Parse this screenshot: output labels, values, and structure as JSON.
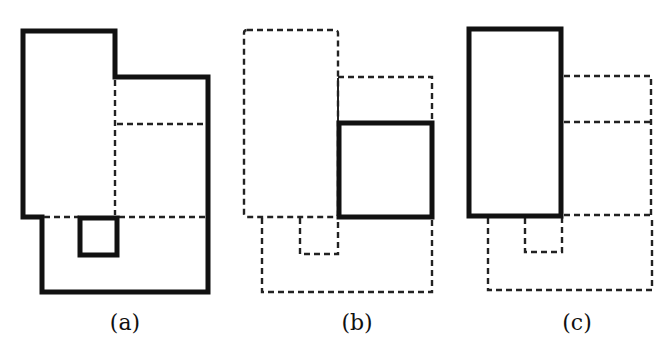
{
  "figure": {
    "panels": [
      {
        "id": "a",
        "label": "(a)",
        "description": "Full floorplan outline highlighted; small inner room highlighted",
        "thick_shapes": [
          "outer-outline",
          "small-square"
        ],
        "dashed_shapes": [
          "internal-partition-lines"
        ]
      },
      {
        "id": "b",
        "label": "(b)",
        "description": "Right-middle square room highlighted; all other rooms dashed",
        "thick_shapes": [
          "right-middle-square"
        ],
        "dashed_shapes": [
          "left-tall-rect",
          "upper-right-rect",
          "small-square",
          "bottom-region"
        ]
      },
      {
        "id": "c",
        "label": "(c)",
        "description": "Left tall room highlighted; all other rooms dashed",
        "thick_shapes": [
          "left-tall-rect"
        ],
        "dashed_shapes": [
          "upper-right-rect",
          "right-middle-square",
          "small-square",
          "bottom-region"
        ]
      }
    ],
    "colors": {
      "stroke": "#111111",
      "background": "#ffffff"
    }
  }
}
